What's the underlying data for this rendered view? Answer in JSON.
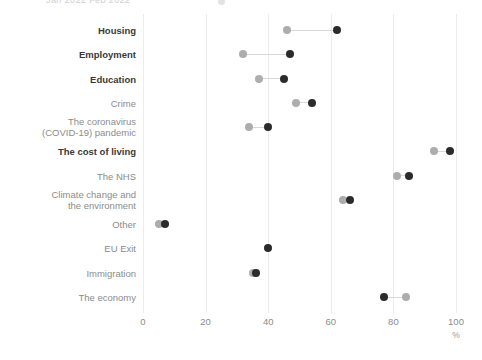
{
  "legend_sliver": {
    "text": "Jan 2022    Feb 2022",
    "dot_name": "legend-marker"
  },
  "axis": {
    "x_ticks": [
      "0",
      "20",
      "40",
      "60",
      "80",
      "100"
    ],
    "x_unit": "%",
    "x_min": 0,
    "x_max": 100
  },
  "colors": {
    "light_marker": "#adadad",
    "dark_marker": "#2b2b2b",
    "connector": "#d8d8d8",
    "gridline": "#ececec",
    "label_muted": "#8c8c8c",
    "label_bold": "#3a3a3a"
  },
  "chart_data": {
    "type": "scatter",
    "title": "",
    "subtitle": "",
    "xlabel": "%",
    "ylabel": "",
    "xlim": [
      0,
      100
    ],
    "grid": true,
    "legend_position": "top",
    "categories": [
      "Housing",
      "Employment",
      "Education",
      "Crime",
      "The coronavirus (COVID-19) pandemic",
      "The cost of living",
      "The NHS",
      "Climate change and the environment",
      "Other",
      "EU Exit",
      "Immigration",
      "The economy"
    ],
    "category_lines": [
      [
        "Housing"
      ],
      [
        "Employment"
      ],
      [
        "Education"
      ],
      [
        "Crime"
      ],
      [
        "The coronavirus",
        "(COVID-19) pandemic"
      ],
      [
        "The cost of living"
      ],
      [
        "The NHS"
      ],
      [
        "Climate change and",
        "the environment"
      ],
      [
        "Other"
      ],
      [
        "EU Exit"
      ],
      [
        "Immigration"
      ],
      [
        "The economy"
      ]
    ],
    "category_emphasis": [
      true,
      true,
      true,
      false,
      false,
      true,
      false,
      false,
      false,
      false,
      false,
      false
    ],
    "series": [
      {
        "name": "light",
        "values": [
          46,
          32,
          37,
          49,
          34,
          93,
          81,
          64,
          5,
          null,
          35,
          84
        ]
      },
      {
        "name": "dark",
        "values": [
          62,
          47,
          45,
          54,
          40,
          98,
          85,
          66,
          7,
          40,
          36,
          77
        ]
      }
    ]
  }
}
